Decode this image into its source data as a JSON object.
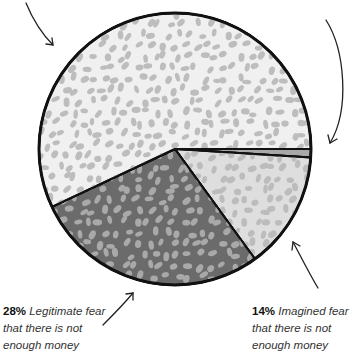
{
  "chart_data": {
    "type": "pie",
    "title": "",
    "start_angle_deg": 0,
    "direction": "clockwise",
    "slices": [
      {
        "name": "thin-slice",
        "label": "",
        "value": 1,
        "fill": "#a8a8a8",
        "dot": "#a8a8a8"
      },
      {
        "name": "imagined-fear",
        "label": "14%",
        "desc": "Imagined fear that there is not enough money",
        "value": 14,
        "fill": "#dedede",
        "dot": "#bcbcbc"
      },
      {
        "name": "legitimate-fear",
        "label": "28%",
        "desc": "Legitimate fear that there is not enough money",
        "value": 28,
        "fill": "#6b6b6b",
        "dot": "#a9a9a9"
      },
      {
        "name": "large-slice",
        "label": "",
        "value": 57,
        "fill": "#f0f0f0",
        "dot": "#bdbdbd"
      }
    ]
  },
  "labels": {
    "left": {
      "pct": "28%",
      "desc": " Legitimate fear that there is not enough money"
    },
    "right": {
      "pct": "14%",
      "desc": " Imagined fear that there is not enough money"
    }
  }
}
